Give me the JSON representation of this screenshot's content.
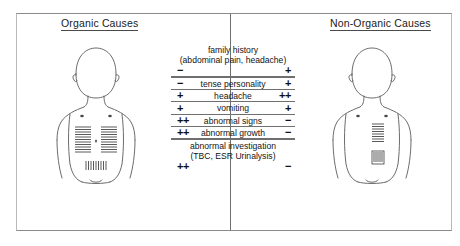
{
  "headings": {
    "left": "Organic Causes",
    "right": "Non-Organic Causes"
  },
  "figures": {
    "left_name": "child-torso-organic",
    "right_name": "child-torso-non-organic"
  },
  "table": {
    "rows": [
      {
        "label": "family history",
        "sublabel": "(abdominal pain, headache)",
        "left_sign": "−",
        "right_sign": "+"
      },
      {
        "label": "tense personality",
        "sublabel": "",
        "left_sign": "−",
        "right_sign": "+"
      },
      {
        "label": "headache",
        "sublabel": "",
        "left_sign": "+",
        "right_sign": "++"
      },
      {
        "label": "vomiting",
        "sublabel": "",
        "left_sign": "+",
        "right_sign": "+"
      },
      {
        "label": "abnormal signs",
        "sublabel": "",
        "left_sign": "++",
        "right_sign": "−"
      },
      {
        "label": "abnormal growth",
        "sublabel": "",
        "left_sign": "++",
        "right_sign": "−"
      },
      {
        "label": "abnormal investigation",
        "sublabel": "(TBC, ESR Urinalysis)",
        "left_sign": "++",
        "right_sign": "−"
      }
    ]
  },
  "colors": {
    "rule": "#6f6f6f",
    "frame": "#8b8b8b",
    "text": "#111111"
  }
}
